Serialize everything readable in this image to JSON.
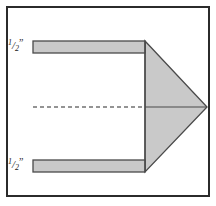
{
  "figure": {
    "background_color": "#ffffff",
    "border": {
      "color": "#2b2b2b",
      "x": 6,
      "y": 6,
      "width": 204,
      "height": 191,
      "stroke_width": 2
    },
    "fill_color": "#c9c9c9",
    "outline_color": "#4a4a4a",
    "centerline_color": "#2b2b2b"
  },
  "labels": {
    "top": {
      "numerator": "1",
      "slash": "/",
      "denominator": "2",
      "unit": "”",
      "full_text": "1/2\""
    },
    "bottom": {
      "numerator": "1",
      "slash": "/",
      "denominator": "2",
      "unit": "”",
      "full_text": "1/2\""
    }
  },
  "geometry": {
    "top_bar": {
      "x": 33,
      "y": 41,
      "width": 112,
      "height": 12
    },
    "bottom_bar": {
      "x": 33,
      "y": 160,
      "width": 112,
      "height": 12
    },
    "triangle": {
      "apex_x": 207,
      "apex_y": 107,
      "base_x": 145,
      "base_top_y": 41,
      "base_bottom_y": 172
    },
    "centerline": {
      "x1": 33,
      "y1": 107,
      "x2": 207,
      "y2": 107,
      "dash": "4 3"
    }
  }
}
